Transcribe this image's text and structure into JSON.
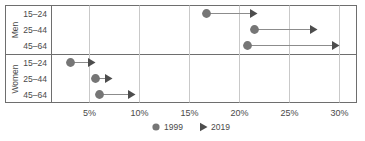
{
  "chart_data": {
    "type": "scatter",
    "title": "",
    "subtitle": "",
    "xlabel": "",
    "ylabel": "",
    "orientation": "horizontal",
    "xlim": [
      0,
      32
    ],
    "xticks": [
      5,
      10,
      15,
      20,
      25,
      30
    ],
    "xtick_labels": [
      "5%",
      "10%",
      "15%",
      "20%",
      "25%",
      "30%"
    ],
    "grid": "vertical",
    "legend_position": "bottom-center",
    "groups": [
      {
        "name": "Men",
        "categories": [
          "15–24",
          "25–44",
          "45–64"
        ]
      },
      {
        "name": "Women",
        "categories": [
          "15–24",
          "25–44",
          "45–64"
        ]
      }
    ],
    "series": [
      {
        "name": "1999",
        "marker": "circle",
        "color": "#767676",
        "values": [
          16.7,
          21.5,
          20.8,
          3.1,
          5.6,
          6.0
        ]
      },
      {
        "name": "2019",
        "marker": "triangle-right",
        "color": "#4d4d4d",
        "values": [
          21.8,
          27.8,
          30.0,
          5.6,
          7.3,
          9.6
        ]
      }
    ],
    "points": [
      {
        "group": "Men",
        "category": "15–24",
        "v1999": 16.7,
        "v2019": 21.8
      },
      {
        "group": "Men",
        "category": "25–44",
        "v1999": 21.5,
        "v2019": 27.8
      },
      {
        "group": "Men",
        "category": "45–64",
        "v1999": 20.8,
        "v2019": 30.0
      },
      {
        "group": "Women",
        "category": "15–24",
        "v1999": 3.1,
        "v2019": 5.6
      },
      {
        "group": "Women",
        "category": "25–44",
        "v1999": 5.6,
        "v2019": 7.3
      },
      {
        "group": "Women",
        "category": "45–64",
        "v1999": 6.0,
        "v2019": 9.6
      }
    ],
    "legend": [
      {
        "label": "1999",
        "marker": "circle",
        "color": "#767676"
      },
      {
        "label": "2019",
        "marker": "triangle-right",
        "color": "#4d4d4d"
      }
    ]
  },
  "style": {
    "frame_color": "#6e6e6e",
    "grid_color": "#c9c9c9",
    "connector_color": "#8c8c8c",
    "text_color": "#4a4a4a",
    "background": "#ffffff"
  }
}
